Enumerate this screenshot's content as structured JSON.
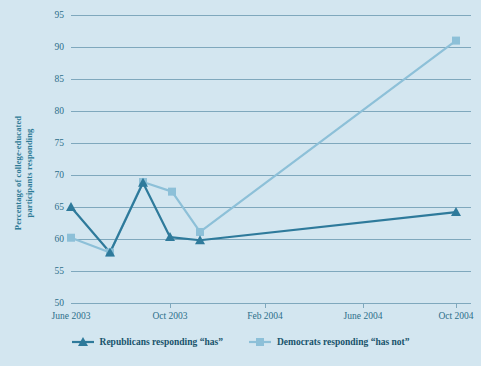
{
  "chart_data": {
    "type": "line",
    "title": "",
    "xlabel": "",
    "ylabel": "Percentage of college-educated participants responding",
    "ylim": [
      50,
      95
    ],
    "yticks": [
      50,
      55,
      60,
      65,
      70,
      75,
      80,
      85,
      90,
      95
    ],
    "xticklabels": [
      "June 2003",
      "Oct 2003",
      "Feb 2004",
      "June 2004",
      "Oct 2004"
    ],
    "xtick_positions": [
      0,
      99,
      194,
      292,
      385
    ],
    "grid": true,
    "legend_position": "bottom",
    "series": [
      {
        "name": "Republicans responding “has”",
        "marker": "triangle",
        "color": "#2e7a9b",
        "points": [
          {
            "x": 0,
            "y": 65.0
          },
          {
            "x": 39,
            "y": 57.9
          },
          {
            "x": 72,
            "y": 68.8
          },
          {
            "x": 99,
            "y": 60.3
          },
          {
            "x": 129,
            "y": 59.8
          },
          {
            "x": 385,
            "y": 64.2
          }
        ]
      },
      {
        "name": "Democrats responding “has not”",
        "marker": "square",
        "color": "#8dc0d8",
        "points": [
          {
            "x": 0,
            "y": 60.2
          },
          {
            "x": 39,
            "y": 57.9
          },
          {
            "x": 72,
            "y": 68.9
          },
          {
            "x": 101,
            "y": 67.4
          },
          {
            "x": 129,
            "y": 61.1
          },
          {
            "x": 385,
            "y": 91.0
          }
        ]
      }
    ]
  },
  "yaxis": {
    "title": "Percentage of college-educated participants responding",
    "ticks": [
      "95",
      "90",
      "85",
      "80",
      "75",
      "70",
      "65",
      "60",
      "55",
      "50"
    ]
  },
  "xaxis": {
    "ticks": [
      "June 2003",
      "Oct 2003",
      "Feb 2004",
      "June 2004",
      "Oct 2004"
    ]
  },
  "legend": {
    "items": [
      {
        "label": "Republicans responding “has”",
        "marker": "triangle-marker-icon",
        "color": "#2e7a9b"
      },
      {
        "label": "Democrats responding “has not”",
        "marker": "square-marker-icon",
        "color": "#8dc0d8"
      }
    ]
  },
  "colors": {
    "background": "#d3e6f0",
    "grid": "#7fa8bd",
    "axis_text": "#2d6f8a",
    "axis_title": "#2e7b96",
    "legend_text": "#17536b",
    "series_republicans": "#2e7a9b",
    "series_democrats": "#8dc0d8"
  }
}
